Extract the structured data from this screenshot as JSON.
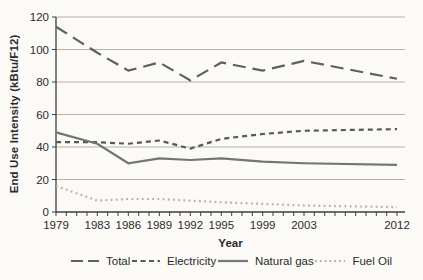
{
  "style": {
    "background": "#fbfaf6",
    "axis_color": "#3f3f3f",
    "grid_color": "#b3b2ae",
    "text_color": "#2b2b2b"
  },
  "chart_data": {
    "type": "line",
    "title": "",
    "xlabel": "Year",
    "ylabel": "End Use Intensity (kBtu/F12)",
    "xlim": [
      1979,
      2012
    ],
    "ylim": [
      0,
      120
    ],
    "grid": "horizontal",
    "legend_position": "bottom",
    "x_minor_tick_step": 1,
    "x": [
      1979,
      1983,
      1986,
      1989,
      1992,
      1995,
      1999,
      2003,
      2012
    ],
    "x_tick_labels": [
      "1979",
      "1983",
      "1986",
      "1989",
      "1992",
      "1995",
      "1999",
      "2003",
      "2012"
    ],
    "y_ticks": [
      0,
      20,
      40,
      60,
      80,
      100,
      120
    ],
    "y_tick_labels": [
      "0",
      "20",
      "40",
      "60",
      "80",
      "100",
      "120"
    ],
    "series": [
      {
        "name": "Total",
        "values": [
          114,
          98,
          87,
          92,
          81,
          92,
          87,
          93,
          82
        ],
        "color": "#5f5f5f",
        "dash": "13 7",
        "legend_dash": "12 5"
      },
      {
        "name": "Electricity",
        "values": [
          43,
          43,
          42,
          44,
          39,
          45,
          48,
          50,
          51
        ],
        "color": "#585858",
        "dash": "5 4",
        "legend_dash": "5 3.5"
      },
      {
        "name": "Natural gas",
        "values": [
          49,
          42,
          30,
          33,
          32,
          33,
          31,
          30,
          29
        ],
        "color": "#757575",
        "dash": "",
        "legend_dash": ""
      },
      {
        "name": "Fuel Oil",
        "values": [
          16,
          7,
          8,
          8,
          7,
          6,
          5,
          4,
          3
        ],
        "color": "#b2b0ad",
        "dash": "1.8 3.4",
        "legend_dash": "1.8 3"
      }
    ]
  }
}
